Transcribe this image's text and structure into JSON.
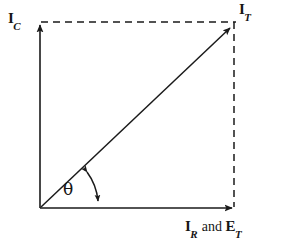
{
  "figure": {
    "type": "phasor-diagram",
    "background_color": "#ffffff",
    "line_color": "#1a1a1a",
    "origin": {
      "x": 40,
      "y": 208
    },
    "axes": {
      "vertical": {
        "from": [
          40,
          208
        ],
        "to": [
          40,
          22
        ],
        "style": "solid",
        "arrow": "end"
      },
      "horizontal": {
        "from": [
          40,
          208
        ],
        "to": [
          236,
          208
        ],
        "style": "solid",
        "arrow": "end"
      }
    },
    "resultant": {
      "from": [
        40,
        208
      ],
      "to": [
        234,
        24
      ],
      "style": "solid",
      "arrow": "end"
    },
    "construction_lines": [
      {
        "from": [
          40,
          22
        ],
        "to": [
          234,
          22
        ],
        "style": "dashed"
      },
      {
        "from": [
          234,
          22
        ],
        "to": [
          234,
          208
        ],
        "style": "dashed"
      }
    ],
    "angle_arc": {
      "label": "θ",
      "arrow": "both",
      "radius": 60,
      "start_deg": 0,
      "end_deg": 44
    }
  },
  "labels": {
    "capacitive_current": {
      "symbol": "I",
      "subscript": "C"
    },
    "total_current": {
      "symbol": "I",
      "subscript": "T"
    },
    "resistive": {
      "symbol": "I",
      "subscript": "R"
    },
    "conjunction": " and ",
    "total_voltage": {
      "symbol": "E",
      "subscript": "T"
    },
    "angle": "θ"
  }
}
